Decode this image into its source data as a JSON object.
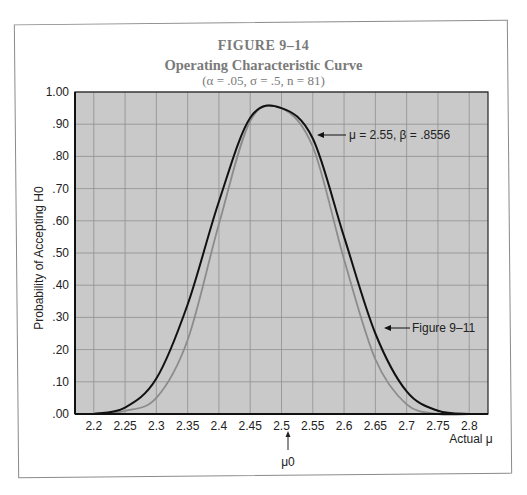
{
  "figure": {
    "number": "FIGURE 9–14",
    "title": "Operating Characteristic Curve",
    "subtitle": "(α = .05, σ = .5, n = 81)"
  },
  "annotations": {
    "point_label": "μ = 2.55, β = .8556",
    "comparison_label": "Figure 9–11",
    "mu0_label": "μ0",
    "mu0_arrow": "↑"
  },
  "colors": {
    "plot_bg": "#c9c9c9",
    "grid": "#8f8f8f",
    "curve_main": "#111111",
    "curve_compare": "#8c8c8c",
    "title_text": "#7a7a7a"
  },
  "chart_data": {
    "type": "line",
    "figure_label": "FIGURE 9–14",
    "xlabel": "Actual μ",
    "ylabel": "Probability of Accepting H0",
    "xlim": [
      2.17,
      2.83
    ],
    "ylim": [
      0,
      1
    ],
    "grid": true,
    "x_ticks": [
      "2.2",
      "2.25",
      "2.3",
      "2.35",
      "2.4",
      "2.45",
      "2.5",
      "2.55",
      "2.6",
      "2.65",
      "2.7",
      "2.75",
      "2.8"
    ],
    "y_ticks": [
      ".00",
      ".10",
      ".20",
      ".30",
      ".40",
      ".50",
      ".60",
      ".70",
      ".80",
      ".90",
      "1.00"
    ],
    "x": [
      2.2,
      2.25,
      2.3,
      2.35,
      2.4,
      2.45,
      2.5,
      2.55,
      2.6,
      2.65,
      2.7,
      2.75,
      2.8
    ],
    "series": [
      {
        "name": "OC curve (n = 81)",
        "color": "#111111",
        "values": [
          0.0,
          0.02,
          0.11,
          0.34,
          0.66,
          0.92,
          0.95,
          0.8556,
          0.55,
          0.25,
          0.07,
          0.01,
          0.0
        ]
      },
      {
        "name": "Figure 9–11",
        "color": "#8c8c8c",
        "values": [
          0.0,
          0.01,
          0.05,
          0.23,
          0.59,
          0.91,
          0.95,
          0.83,
          0.48,
          0.17,
          0.03,
          0.0,
          0.0
        ]
      }
    ],
    "annotations": [
      {
        "text": "μ = 2.55, β = .8556",
        "x": 2.55,
        "y": 0.8556
      },
      {
        "text": "Figure 9–11",
        "x": 2.63,
        "y": 0.3
      },
      {
        "text": "μ0",
        "x": 2.5,
        "y": 0
      }
    ],
    "legend": "none"
  }
}
